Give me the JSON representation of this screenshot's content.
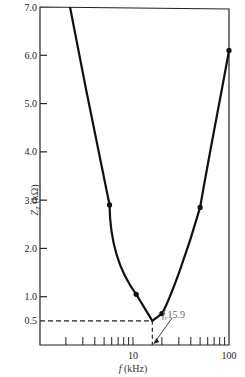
{
  "chart_data": {
    "type": "line",
    "title": "",
    "xlabel": "f (kHz)",
    "ylabel": "Z_T (kΩ)",
    "xscale": "log",
    "xlim": [
      1.07,
      100
    ],
    "ylim": [
      0,
      7.0
    ],
    "x_tick_labels": [
      "10",
      "100"
    ],
    "y_tick_labels": [
      "0.5",
      "1.0",
      "2.0",
      "3.0",
      "4.0",
      "5.0",
      "6.0",
      "7.0"
    ],
    "y_ticks": [
      0.5,
      1.0,
      2.0,
      3.0,
      4.0,
      5.0,
      6.0,
      7.0
    ],
    "grid": false,
    "legend": null,
    "series": [
      {
        "name": "Z_T",
        "points": [
          {
            "x": 5.7,
            "y": 2.9
          },
          {
            "x": 10.8,
            "y": 1.05
          },
          {
            "x": 15.9,
            "y": 0.5
          },
          {
            "x": 20,
            "y": 0.65
          },
          {
            "x": 50,
            "y": 2.85
          },
          {
            "x": 100,
            "y": 6.1
          }
        ]
      }
    ],
    "annotations": [
      {
        "text": "f_r 15.9",
        "x": 15.9,
        "y": 0,
        "note": "resonant frequency, arrow to x-axis"
      },
      {
        "text": "0.5",
        "type": "dashed reference lines",
        "x": 15.9,
        "y": 0.5
      }
    ]
  },
  "labels": {
    "y_title": "Z",
    "y_title_sub": "T",
    "y_title_unit": " (kΩ)",
    "x_title_f": "f",
    "x_title_unit": " (kHz)",
    "fr_main": "f",
    "fr_sub": "r",
    "fr_value": "15.9"
  }
}
